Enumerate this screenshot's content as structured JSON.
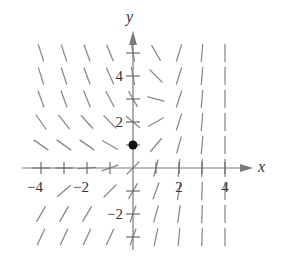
{
  "figure": {
    "type": "slope-field",
    "axes": {
      "x_label": "x",
      "y_label": "y",
      "x_tick_labels": [
        {
          "value": -4,
          "text": "−4"
        },
        {
          "value": -2,
          "text": "−2"
        },
        {
          "value": 2,
          "text": "2"
        },
        {
          "value": 4,
          "text": "4"
        }
      ],
      "y_tick_labels": [
        {
          "value": 4,
          "text": "4"
        },
        {
          "value": 2,
          "text": "2"
        },
        {
          "value": -2,
          "text": "−2"
        }
      ],
      "x_range": [
        -4,
        4
      ],
      "y_range": [
        -3,
        5
      ]
    },
    "initial_point": {
      "x": 0,
      "y": 1
    },
    "colors": {
      "segments": "#8a8a8a",
      "axes": "#7a7a7a",
      "point": "#111111",
      "text": "#333333"
    },
    "grid_x": [
      -4,
      -3,
      -2,
      -1,
      0,
      1,
      2,
      3,
      4
    ],
    "grid_y": [
      5,
      4,
      3,
      2,
      1,
      0,
      -1,
      -2,
      -3
    ],
    "angles_deg": [
      [
        -72,
        -72,
        -70,
        -68,
        -80,
        -60,
        72,
        85,
        90
      ],
      [
        -72,
        -72,
        -70,
        -66,
        -80,
        -45,
        72,
        85,
        90
      ],
      [
        -70,
        -70,
        -68,
        -62,
        -60,
        -15,
        72,
        85,
        90
      ],
      [
        -55,
        -52,
        -48,
        -45,
        -40,
        30,
        72,
        85,
        90
      ],
      [
        -35,
        -35,
        -35,
        -30,
        null,
        50,
        75,
        85,
        90
      ],
      [
        0,
        0,
        5,
        20,
        45,
        75,
        85,
        88,
        90
      ],
      [
        null,
        40,
        null,
        45,
        60,
        70,
        80,
        88,
        90
      ],
      [
        60,
        60,
        60,
        null,
        70,
        75,
        82,
        88,
        90
      ],
      [
        65,
        65,
        65,
        65,
        70,
        78,
        85,
        88,
        90
      ]
    ]
  }
}
